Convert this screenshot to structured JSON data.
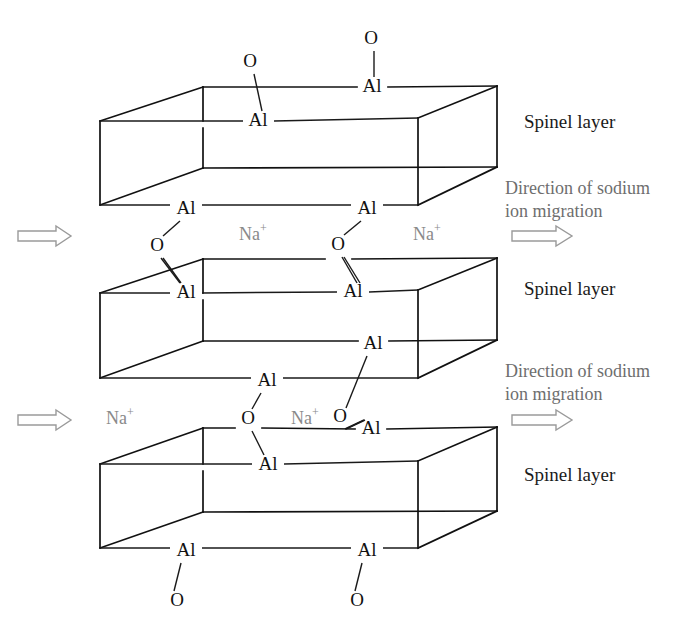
{
  "figure": {
    "background_color": "#ffffff",
    "line_color": "#111111",
    "atom_text_color": "#111111",
    "sodium_text_color": "#8a8a8a",
    "direction_text_color": "#6e6e6e",
    "spinel_text_color": "#1b1b1b"
  },
  "labels": {
    "aluminium": "Al",
    "oxygen": "O",
    "sodium": "Na",
    "sodium_charge": "+",
    "spinel_layer": "Spinel layer",
    "direction_line1": "Direction of sodium",
    "direction_line2": "ion migration"
  },
  "spinel_layers": [
    {
      "id": "spinel-layer-1",
      "label": "Spinel layer",
      "label_x": 524,
      "label_y": 124
    },
    {
      "id": "spinel-layer-2",
      "label": "Spinel layer",
      "label_x": 524,
      "label_y": 291
    },
    {
      "id": "spinel-layer-3",
      "label": "Spinel layer",
      "label_x": 524,
      "label_y": 477
    }
  ],
  "migration_annotations": [
    {
      "id": "migration-annotation-1",
      "line1": "Direction of sodium",
      "line2": "ion migration",
      "line1_x": 505,
      "line1_y": 190,
      "line2_x": 505,
      "line2_y": 213,
      "arrow_x": 512,
      "arrow_y": 236,
      "arrow_len": 60
    },
    {
      "id": "migration-annotation-2",
      "line1": "Direction of sodium",
      "line2": "ion migration",
      "line1_x": 505,
      "line1_y": 373,
      "line2_x": 505,
      "line2_y": 396,
      "arrow_x": 512,
      "arrow_y": 420,
      "arrow_len": 60
    }
  ],
  "left_arrows": [
    {
      "id": "left-arrow-1",
      "x": 18,
      "y": 236,
      "len": 52
    },
    {
      "id": "left-arrow-2",
      "x": 18,
      "y": 420,
      "len": 52
    }
  ],
  "boxes": [
    {
      "id": "spinel-box-1",
      "front_top_left": [
        100,
        121
      ],
      "front_top_right": [
        418,
        118
      ],
      "front_bottom_left": [
        100,
        205
      ],
      "front_bottom_right": [
        418,
        205
      ],
      "back_top_left": [
        203,
        87
      ],
      "back_top_right": [
        497,
        86
      ],
      "back_bottom_left": [
        203,
        168
      ],
      "back_bottom_right": [
        497,
        167
      ]
    },
    {
      "id": "spinel-box-2",
      "front_top_left": [
        100,
        293
      ],
      "front_top_right": [
        418,
        290
      ],
      "front_bottom_left": [
        100,
        378
      ],
      "front_bottom_right": [
        418,
        378
      ],
      "back_top_left": [
        203,
        259
      ],
      "back_top_right": [
        497,
        258
      ],
      "back_bottom_left": [
        203,
        341
      ],
      "back_bottom_right": [
        497,
        340
      ]
    },
    {
      "id": "spinel-box-3",
      "front_top_left": [
        100,
        464
      ],
      "front_top_right": [
        418,
        461
      ],
      "front_bottom_left": [
        100,
        548
      ],
      "front_bottom_right": [
        418,
        548
      ],
      "back_top_left": [
        203,
        428
      ],
      "back_top_right": [
        497,
        427
      ],
      "back_bottom_left": [
        203,
        512
      ],
      "back_bottom_right": [
        497,
        511
      ]
    }
  ],
  "atoms": [
    {
      "id": "o-top-1",
      "element": "O",
      "x": 250,
      "y": 63
    },
    {
      "id": "o-top-2",
      "element": "O",
      "x": 371,
      "y": 40
    },
    {
      "id": "al-b1-back-right",
      "element": "Al",
      "x": 372,
      "y": 88
    },
    {
      "id": "al-b1-front-top",
      "element": "Al",
      "x": 258,
      "y": 122
    },
    {
      "id": "al-b1-bottom-left",
      "element": "Al",
      "x": 186,
      "y": 210
    },
    {
      "id": "al-b1-bottom-right",
      "element": "Al",
      "x": 367,
      "y": 210
    },
    {
      "id": "o-gap1-left",
      "element": "O",
      "x": 157,
      "y": 247
    },
    {
      "id": "o-gap1-right",
      "element": "O",
      "x": 338,
      "y": 246
    },
    {
      "id": "al-b2-front-top-left",
      "element": "Al",
      "x": 186,
      "y": 294
    },
    {
      "id": "al-b2-front-top-right",
      "element": "Al",
      "x": 353,
      "y": 293
    },
    {
      "id": "al-b2-back-bottom-right",
      "element": "Al",
      "x": 373,
      "y": 345
    },
    {
      "id": "al-b2-bottom",
      "element": "Al",
      "x": 267,
      "y": 382
    },
    {
      "id": "o-gap2-left",
      "element": "O",
      "x": 248,
      "y": 420
    },
    {
      "id": "o-gap2-right",
      "element": "O",
      "x": 340,
      "y": 418
    },
    {
      "id": "al-b3-back-top-right",
      "element": "Al",
      "x": 371,
      "y": 430
    },
    {
      "id": "al-b3-front-top",
      "element": "Al",
      "x": 268,
      "y": 466
    },
    {
      "id": "al-b3-bottom-left",
      "element": "Al",
      "x": 186,
      "y": 552
    },
    {
      "id": "al-b3-bottom-right",
      "element": "Al",
      "x": 367,
      "y": 552
    },
    {
      "id": "o-bottom-1",
      "element": "O",
      "x": 177,
      "y": 602
    },
    {
      "id": "o-bottom-2",
      "element": "O",
      "x": 357,
      "y": 602
    }
  ],
  "sodium_ions": [
    {
      "id": "sodium-ion-1",
      "x": 253,
      "y": 236
    },
    {
      "id": "sodium-ion-2",
      "x": 427,
      "y": 236
    },
    {
      "id": "sodium-ion-3",
      "x": 120,
      "y": 420
    },
    {
      "id": "sodium-ion-4",
      "x": 305,
      "y": 420
    }
  ]
}
